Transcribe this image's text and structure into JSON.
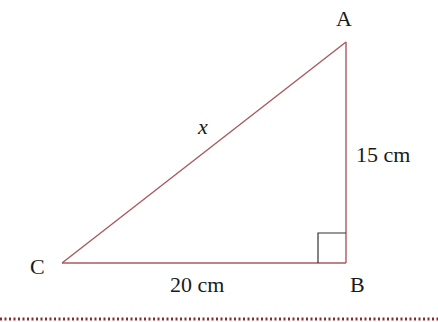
{
  "diagram": {
    "type": "right-triangle",
    "vertices": {
      "A": {
        "label": "A",
        "x": 346,
        "y": 42
      },
      "B": {
        "label": "B",
        "x": 346,
        "y": 263
      },
      "C": {
        "label": "C",
        "x": 62,
        "y": 263
      }
    },
    "right_angle_at": "B",
    "sides": {
      "hypotenuse": {
        "label": "x",
        "from": "C",
        "to": "A"
      },
      "vertical": {
        "label": "15 cm",
        "from": "A",
        "to": "B"
      },
      "horizontal": {
        "label": "20 cm",
        "from": "C",
        "to": "B"
      }
    },
    "colors": {
      "edge": "#a85a5f",
      "right_angle_marker": "#333333",
      "text": "#1a1a1a",
      "divider": "#8b2a2a"
    }
  }
}
